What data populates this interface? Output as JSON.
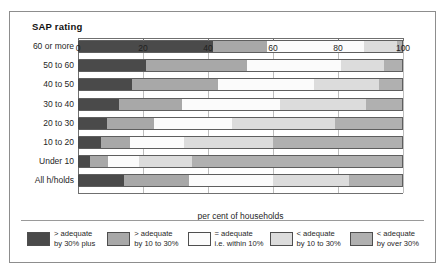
{
  "chart_data": {
    "type": "bar",
    "subtype": "stacked-horizontal-100-percent",
    "title": "SAP rating",
    "xlabel": "per cent  of households",
    "ylabel": "SAP rating",
    "xlim": [
      0,
      100
    ],
    "xticks": [
      0,
      20,
      40,
      60,
      80,
      100
    ],
    "xtick_labels": [
      "0",
      "20",
      "40",
      "60",
      "80",
      "100"
    ],
    "grid": true,
    "grid_axis": "x",
    "legend_position": "bottom",
    "categories": [
      "60 or more",
      "50 to 60",
      "40 to 50",
      "30 to 40",
      "20 to 30",
      "10 to 20",
      "Under 10",
      "All h/holds"
    ],
    "series": [
      {
        "name": "> adequate by 30% plus",
        "label_line1": "> adequate",
        "label_line2": "by 30% plus",
        "color": "#4a4a4a",
        "values": [
          41.5,
          21.0,
          16.5,
          12.5,
          9.0,
          7.0,
          3.7,
          14.0
        ]
      },
      {
        "name": "> adequate by 10 to 30%",
        "label_line1": "> adequate",
        "label_line2": "by 10 to 30%",
        "color": "#a8a8a8",
        "values": [
          16.5,
          31.0,
          26.5,
          19.5,
          14.5,
          9.0,
          5.5,
          20.0
        ]
      },
      {
        "name": "= adequate i.e. within 10%",
        "label_line1": "= adequate",
        "label_line2": "i.e. within 10%",
        "color": "#fbfbfb",
        "values": [
          30.0,
          29.0,
          29.5,
          30.0,
          24.0,
          16.5,
          9.6,
          26.0
        ]
      },
      {
        "name": "< adequate by 10 to 30%",
        "label_line1": "< adequate",
        "label_line2": "by 10 to 30%",
        "color": "#dcdcdc",
        "values": [
          10.0,
          13.0,
          20.0,
          26.5,
          31.5,
          27.5,
          16.2,
          23.5
        ]
      },
      {
        "name": "< adequate by over 30%",
        "label_line1": "< adequate",
        "label_line2": "by over 30%",
        "color": "#b0b0b0",
        "values": [
          2.0,
          6.0,
          7.5,
          11.5,
          21.0,
          40.0,
          65.0,
          16.5
        ]
      }
    ]
  }
}
